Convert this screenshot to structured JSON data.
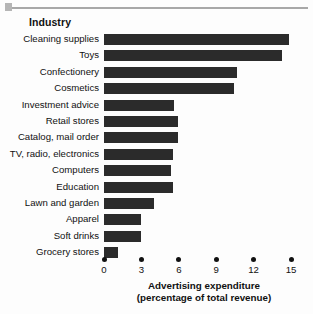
{
  "chart_data": {
    "type": "bar",
    "orientation": "horizontal",
    "title": "",
    "category_header": "Industry",
    "xlabel_line1": "Advertising expenditure",
    "xlabel_line2": "(percentage of total revenue)",
    "ylabel": "Industry",
    "xlim": [
      0,
      15
    ],
    "xticks": [
      0,
      3,
      6,
      9,
      12,
      15
    ],
    "xtick_labels": [
      "0",
      "3",
      "6",
      "9",
      "12",
      "15"
    ],
    "grid": false,
    "legend": false,
    "bar_color": "#2b2b2b",
    "categories": [
      "Cleaning supplies",
      "Toys",
      "Confectionery",
      "Cosmetics",
      "Investment advice",
      "Retail stores",
      "Catalog, mail order",
      "TV, radio, electronics",
      "Computers",
      "Education",
      "Lawn and garden",
      "Apparel",
      "Soft drinks",
      "Grocery stores"
    ],
    "values": [
      14.8,
      14.3,
      10.7,
      10.4,
      5.6,
      5.9,
      5.9,
      5.5,
      5.4,
      5.5,
      4.0,
      3.0,
      3.0,
      1.1
    ]
  }
}
